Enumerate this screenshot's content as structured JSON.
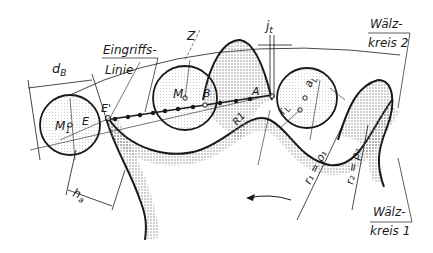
{
  "diagram": {
    "type": "gear-mesh-rolling-circles",
    "colors": {
      "ink": "#1a1a1a",
      "stipple": "#8a8a8a",
      "background": "#ffffff"
    },
    "labels": {
      "d_B": "d",
      "d_B_sub": "B",
      "eingriffslinie_1": "Eingriffs-",
      "eingriffslinie_2": "Linie",
      "Z": "Z",
      "j_t": "j",
      "j_t_sub": "t",
      "waelzkreis2_1": "Wälz-",
      "waelzkreis2_2": "kreis 2",
      "M1": "M",
      "M1_sub": "1",
      "E": "E",
      "E_prime": "E'",
      "M": "M",
      "B": "B",
      "A": "A",
      "R1": "R1",
      "aL": "a",
      "aL_sub": "L",
      "rL": "r",
      "rL_sub": "L",
      "h_a": "h",
      "h_a_sub": "a",
      "r1_rho1": "r₁ = ρ₁",
      "r2_rho2": "r₂ = ρ₂",
      "waelzkreis1_1": "Wälz-",
      "waelzkreis1_2": "kreis 1"
    }
  }
}
